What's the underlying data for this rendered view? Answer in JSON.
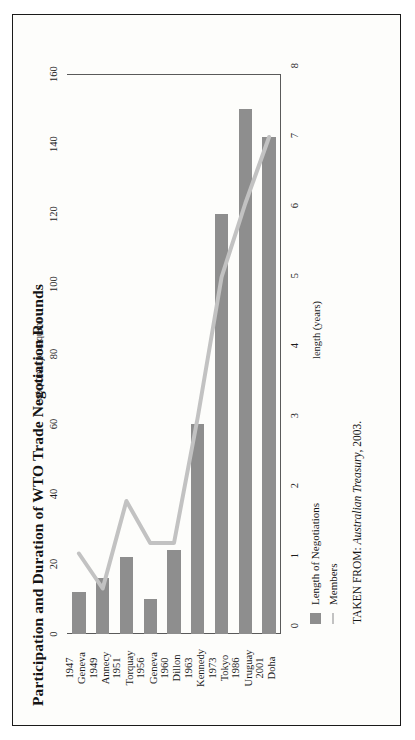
{
  "figure": {
    "title": "Participation and Duration of WTO Trade Negotiation Rounds",
    "source_prefix": "TAKEN FROM: ",
    "source_italic": "Australian Treasury",
    "source_suffix": ", 2003."
  },
  "legend": {
    "items": [
      {
        "label": "Length of Negotiations",
        "marker": "bar-swatch",
        "color": "#8e8e8e"
      },
      {
        "label": "Members",
        "marker": "line-swatch",
        "color": "#c2c2c2"
      }
    ]
  },
  "colors": {
    "bar": "#8e8e8e",
    "line": "#c2c2c2",
    "axis": "#5a5a5a",
    "text": "#141414",
    "frame": "#1a1a1a",
    "page": "#fdfdfb"
  },
  "chart_data": {
    "type": "bar",
    "title": "Participation and Duration of WTO Trade Negotiation Rounds",
    "orientation": "rotated-90-ccw",
    "categories": [
      "1947 Geneva",
      "1949 Annecy",
      "1951 Torquay",
      "1956 Geneva",
      "1960 Dillon",
      "1963 Kennedy",
      "1973 Tokyo",
      "1986 Uruguay",
      "2001 Doha"
    ],
    "category_years": [
      "1947",
      "1949",
      "1951",
      "1956",
      "1960",
      "1963",
      "1973",
      "1986",
      "2001"
    ],
    "category_places": [
      "Geneva",
      "Annecy",
      "Torquay",
      "Geneva",
      "Dillon",
      "Kennedy",
      "Tokyo",
      "Uruguay",
      "Doha"
    ],
    "series": [
      {
        "name": "Length of Negotiations",
        "type": "bar",
        "axis": "length",
        "unit": "years",
        "values": [
          0.6,
          0.8,
          1.1,
          0.5,
          1.2,
          3.0,
          6.0,
          7.5,
          7.1
        ]
      },
      {
        "name": "Members",
        "type": "line",
        "axis": "members",
        "unit": "number of members",
        "values": [
          23,
          13,
          38,
          26,
          26,
          62,
          102,
          123,
          142
        ]
      }
    ],
    "xlabel": "",
    "ylabel": "length (years)",
    "y2label": "number of members",
    "ylim": [
      0,
      8
    ],
    "y2lim": [
      0,
      160
    ],
    "yticks": [
      "0",
      "1",
      "2",
      "3",
      "4",
      "5",
      "6",
      "7",
      "8"
    ],
    "y2ticks": [
      "0",
      "20",
      "40",
      "60",
      "80",
      "100",
      "120",
      "140",
      "160"
    ],
    "grid": false,
    "legend_position": "below-left"
  }
}
